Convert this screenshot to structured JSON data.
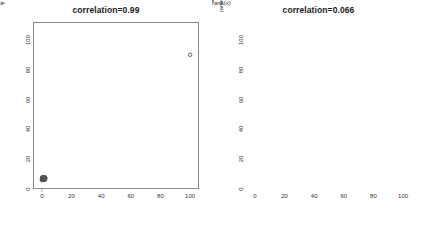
{
  "figure": {
    "background": "#ffffff",
    "frame_color": "#8a8a8a",
    "point_color": "#555555",
    "line_color": "#6b6b6b"
  },
  "chart_data": [
    {
      "type": "scatter",
      "title": "correlation=0.99",
      "xlabel": "x",
      "ylabel": "y",
      "xlim": [
        -6,
        106
      ],
      "ylim": [
        -6,
        106
      ],
      "xticks": [
        0,
        20,
        40,
        60,
        80,
        100
      ],
      "yticks": [
        0,
        20,
        40,
        60,
        80,
        100
      ],
      "grid": false,
      "legend": null,
      "annotation": "Tight cluster of points near the origin plus one extreme outlier near (100, 84); the single outlier drives the Pearson correlation to 0.99.",
      "points": [
        [
          0.0,
          0.0
        ],
        [
          0.4,
          0.2
        ],
        [
          0.9,
          0.5
        ],
        [
          1.4,
          0.1
        ],
        [
          0.2,
          0.9
        ],
        [
          1.1,
          1.2
        ],
        [
          0.6,
          1.5
        ],
        [
          1.8,
          0.7
        ],
        [
          0.3,
          1.8
        ],
        [
          1.5,
          1.6
        ],
        [
          2.0,
          0.4
        ],
        [
          0.1,
          0.3
        ],
        [
          0.8,
          2.0
        ],
        [
          1.2,
          0.9
        ],
        [
          1.7,
          1.3
        ],
        [
          0.5,
          0.6
        ],
        [
          2.2,
          1.0
        ],
        [
          0.7,
          1.1
        ],
        [
          1.3,
          1.9
        ],
        [
          1.0,
          0.2
        ],
        [
          1.9,
          1.7
        ],
        [
          0.4,
          1.4
        ],
        [
          2.1,
          0.6
        ],
        [
          0.9,
          1.0
        ],
        [
          1.6,
          0.3
        ],
        [
          0.2,
          1.6
        ],
        [
          1.1,
          0.8
        ],
        [
          2.3,
          1.4
        ],
        [
          0.6,
          0.4
        ],
        [
          1.4,
          1.1
        ],
        [
          0.3,
          1.2
        ],
        [
          1.8,
          1.9
        ],
        [
          0.8,
          0.7
        ],
        [
          2.0,
          1.8
        ],
        [
          1.2,
          0.5
        ],
        [
          0.5,
          1.7
        ],
        [
          1.5,
          0.9
        ],
        [
          0.1,
          1.0
        ],
        [
          1.0,
          1.5
        ],
        [
          1.7,
          0.2
        ],
        [
          100.0,
          84.0
        ]
      ]
    },
    {
      "type": "scatter",
      "title": "correlation=0.066",
      "xlabel": "rank(x)",
      "ylabel": "rank(y)",
      "xlim": [
        -6,
        106
      ],
      "ylim": [
        -6,
        106
      ],
      "xticks": [
        0,
        20,
        40,
        60,
        80,
        100
      ],
      "yticks": [
        0,
        20,
        40,
        60,
        80,
        100
      ],
      "grid": false,
      "legend": null,
      "annotation": "Rank-transformed data scatter with an overlaid y = x reference line; ranks show essentially no association (correlation 0.066).",
      "reference_line": {
        "from": [
          -6,
          -6
        ],
        "to": [
          106,
          106
        ],
        "equation": "y = x"
      },
      "points": [
        [
          2,
          26
        ],
        [
          3,
          45
        ],
        [
          4,
          7
        ],
        [
          5,
          47
        ],
        [
          5,
          91
        ],
        [
          6,
          57
        ],
        [
          7,
          70
        ],
        [
          8,
          39
        ],
        [
          9,
          94
        ],
        [
          10,
          28
        ],
        [
          10,
          64
        ],
        [
          11,
          54
        ],
        [
          12,
          20
        ],
        [
          13,
          29
        ],
        [
          13,
          88
        ],
        [
          14,
          61
        ],
        [
          15,
          94
        ],
        [
          16,
          13
        ],
        [
          16,
          85
        ],
        [
          17,
          21
        ],
        [
          18,
          30
        ],
        [
          18,
          89
        ],
        [
          19,
          17
        ],
        [
          20,
          59
        ],
        [
          21,
          88
        ],
        [
          22,
          50
        ],
        [
          23,
          28
        ],
        [
          23,
          80
        ],
        [
          24,
          15
        ],
        [
          25,
          43
        ],
        [
          26,
          4
        ],
        [
          27,
          23
        ],
        [
          28,
          57
        ],
        [
          29,
          84
        ],
        [
          30,
          32
        ],
        [
          31,
          84
        ],
        [
          32,
          20
        ],
        [
          33,
          1
        ],
        [
          34,
          95
        ],
        [
          35,
          5
        ],
        [
          36,
          68
        ],
        [
          37,
          31
        ],
        [
          38,
          38
        ],
        [
          39,
          11
        ],
        [
          40,
          46
        ],
        [
          41,
          55
        ],
        [
          42,
          32
        ],
        [
          43,
          97
        ],
        [
          44,
          41
        ],
        [
          45,
          46
        ],
        [
          46,
          73
        ],
        [
          47,
          52
        ],
        [
          48,
          79
        ],
        [
          48,
          98
        ],
        [
          49,
          62
        ],
        [
          50,
          85
        ],
        [
          51,
          36
        ],
        [
          52,
          19
        ],
        [
          52,
          99
        ],
        [
          53,
          24
        ],
        [
          54,
          44
        ],
        [
          55,
          35
        ],
        [
          56,
          93
        ],
        [
          57,
          68
        ],
        [
          58,
          40
        ],
        [
          59,
          34
        ],
        [
          60,
          77
        ],
        [
          61,
          48
        ],
        [
          62,
          99
        ],
        [
          63,
          71
        ],
        [
          64,
          9
        ],
        [
          65,
          35
        ],
        [
          66,
          87
        ],
        [
          67,
          14
        ],
        [
          68,
          71
        ],
        [
          69,
          51
        ],
        [
          70,
          60
        ],
        [
          71,
          91
        ],
        [
          72,
          2
        ],
        [
          73,
          29
        ],
        [
          74,
          16
        ],
        [
          75,
          45
        ],
        [
          76,
          3
        ],
        [
          77,
          92
        ],
        [
          78,
          22
        ],
        [
          79,
          74
        ],
        [
          80,
          33
        ],
        [
          81,
          3
        ],
        [
          82,
          47
        ],
        [
          83,
          27
        ],
        [
          84,
          66
        ],
        [
          85,
          65
        ],
        [
          86,
          9
        ],
        [
          87,
          63
        ],
        [
          88,
          11
        ],
        [
          89,
          65
        ],
        [
          90,
          13
        ],
        [
          91,
          14
        ],
        [
          92,
          27
        ],
        [
          93,
          70
        ],
        [
          95,
          66
        ],
        [
          97,
          15
        ],
        [
          99,
          72
        ],
        [
          100,
          100
        ]
      ]
    }
  ]
}
